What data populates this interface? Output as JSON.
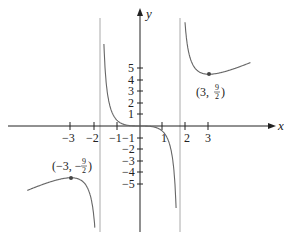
{
  "chart_data": {
    "type": "line",
    "title": "",
    "function": "f(x) = x^3 / (x^2 - 3)",
    "xlabel": "x",
    "ylabel": "y",
    "xlim": [
      -5,
      6
    ],
    "ylim": [
      -10,
      11
    ],
    "grid": false,
    "x_ticks": [
      -3,
      -2,
      -1,
      1,
      2,
      3
    ],
    "x_tick_labels": [
      "−3",
      "−2",
      "−1",
      "1",
      "2",
      "3"
    ],
    "y_ticks": [
      5,
      4,
      3,
      2,
      1,
      -1,
      -2,
      -3,
      -4,
      -5
    ],
    "y_tick_labels": [
      "5",
      "4",
      "3",
      "2",
      "1",
      "−1",
      "−2",
      "−3",
      "−4",
      "−5"
    ],
    "vertical_asymptotes": [
      -1.732,
      1.732
    ],
    "series": [
      {
        "name": "left branch",
        "x": [
          -5.0,
          -4.5,
          -4.0,
          -3.5,
          -3.0,
          -2.5,
          -2.2,
          -2.0,
          -1.9
        ],
        "y": [
          -5.68,
          -5.12,
          -4.92,
          -4.7,
          -4.5,
          -4.93,
          -5.77,
          -8.0,
          -11.2
        ]
      },
      {
        "name": "middle branch",
        "x": [
          -1.55,
          -1.4,
          -1.2,
          -1.0,
          -0.5,
          0,
          0.5,
          1.0,
          1.2,
          1.4,
          1.55
        ],
        "y": [
          6.2,
          4.0,
          2.3,
          0.5,
          0.05,
          0,
          -0.05,
          -0.5,
          -2.3,
          -4.0,
          -6.2
        ]
      },
      {
        "name": "right branch",
        "x": [
          1.9,
          2.0,
          2.2,
          2.5,
          3.0,
          3.5,
          4.0,
          4.5
        ],
        "y": [
          11.2,
          8.0,
          5.77,
          4.93,
          4.5,
          4.7,
          4.92,
          5.12
        ]
      }
    ],
    "annotations": [
      {
        "point": [
          3,
          4.5
        ],
        "label": "(3, 9/2)",
        "type": "local minimum"
      },
      {
        "point": [
          -3,
          -4.5
        ],
        "label": "(−3, −9/2)",
        "type": "local maximum"
      }
    ]
  },
  "labels": {
    "x_axis": "x",
    "y_axis": "y",
    "min_point_open": "(3,",
    "min_point_close": ")",
    "max_point_open": "(−3, −",
    "max_point_close": ")",
    "frac_num": "9",
    "frac_den": "2"
  },
  "colors": {
    "curve": "#666666",
    "axis": "#222222",
    "asymptote": "#aaaaaa",
    "text": "#222222"
  }
}
